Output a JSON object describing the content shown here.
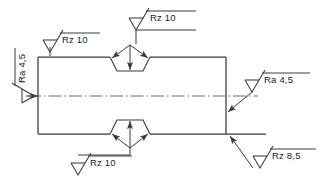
{
  "drawing": {
    "title": "Surface roughness symbol annotation drawing",
    "type": "engineering-technical-drawing",
    "colors": {
      "line": "#3a3a3a",
      "text": "#1a1a1a",
      "background": "#ffffff",
      "centerline": "#6b6b6b"
    },
    "part": {
      "name": "rectangular-part-outline",
      "shape": "rectangle",
      "left": 38,
      "top": 57,
      "right": 226,
      "bottom": 134
    },
    "centerline": {
      "name": "centre-axis-line",
      "style": "dash-dot",
      "y": 96
    },
    "annotations": [
      {
        "id": "top-left",
        "name": "surface-finish-callout-top-left",
        "label": "Rz  10",
        "parameter": "Rz",
        "value": "10",
        "symbol": "machining-required-triangle",
        "rotation": 0,
        "target": "top-edge-left"
      },
      {
        "id": "top-center",
        "name": "surface-finish-callout-top-center",
        "label": "Rz  10",
        "parameter": "Rz",
        "value": "10",
        "symbol": "machining-required-triangle",
        "rotation": 0,
        "target": "top-notch-chamfer"
      },
      {
        "id": "left",
        "name": "surface-finish-callout-left",
        "label": "Ra  4,5",
        "parameter": "Ra",
        "value": "4,5",
        "symbol": "machining-required-triangle",
        "rotation": -90,
        "target": "left-edge"
      },
      {
        "id": "right",
        "name": "surface-finish-callout-right",
        "label": "Ra  4,5",
        "parameter": "Ra",
        "value": "4,5",
        "symbol": "machining-required-triangle",
        "rotation": 0,
        "target": "right-edge"
      },
      {
        "id": "bottom-left",
        "name": "surface-finish-callout-bottom-left",
        "label": "Rz  10",
        "parameter": "Rz",
        "value": "10",
        "symbol": "machining-required-triangle",
        "rotation": 0,
        "target": "bottom-notch-chamfer"
      },
      {
        "id": "bottom-right",
        "name": "surface-finish-callout-bottom-right",
        "label": "Rz  8,5",
        "parameter": "Rz",
        "value": "8,5",
        "symbol": "machining-required-triangle",
        "rotation": 0,
        "target": "bottom-edge-right"
      }
    ]
  }
}
